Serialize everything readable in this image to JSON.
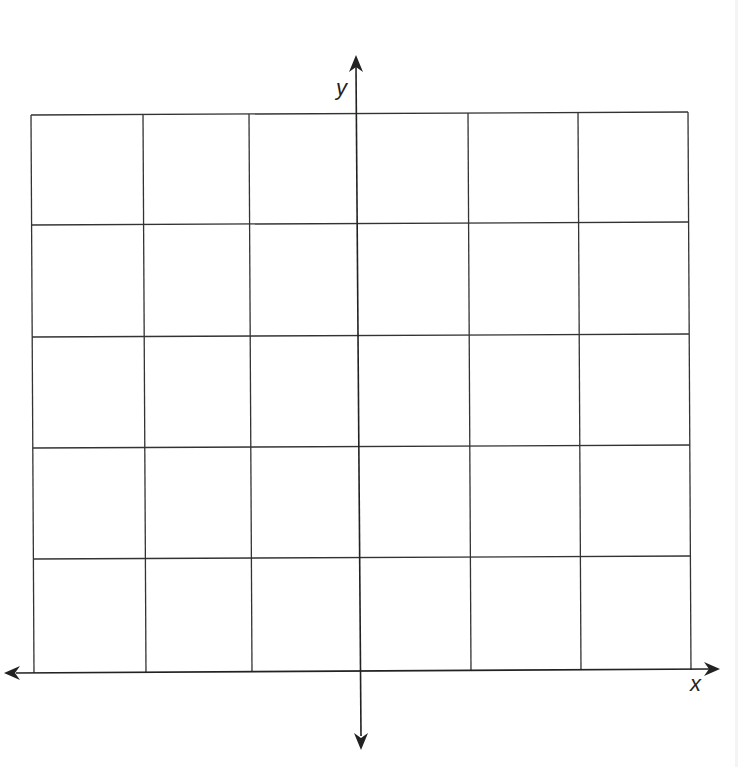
{
  "diagram": {
    "type": "coordinate-grid",
    "grid": {
      "columns": 6,
      "rows": 5,
      "line_color": "#333333",
      "vertical_lines": [
        {
          "x1": 31,
          "y1": 115,
          "x2": 34,
          "y2": 673
        },
        {
          "x1": 143,
          "y1": 114,
          "x2": 146,
          "y2": 673
        },
        {
          "x1": 249,
          "y1": 114,
          "x2": 252,
          "y2": 672
        },
        {
          "x1": 468,
          "y1": 113,
          "x2": 471,
          "y2": 671
        },
        {
          "x1": 578,
          "y1": 112,
          "x2": 581,
          "y2": 670
        },
        {
          "x1": 688,
          "y1": 112,
          "x2": 691,
          "y2": 670
        }
      ],
      "horizontal_lines": [
        {
          "x1": 31,
          "y1": 115,
          "x2": 688,
          "y2": 112
        },
        {
          "x1": 31,
          "y1": 225,
          "x2": 688,
          "y2": 222
        },
        {
          "x1": 32,
          "y1": 337,
          "x2": 689,
          "y2": 334
        },
        {
          "x1": 33,
          "y1": 448,
          "x2": 690,
          "y2": 445
        },
        {
          "x1": 33,
          "y1": 559,
          "x2": 690,
          "y2": 556
        }
      ]
    },
    "axes": {
      "x_axis": {
        "label": "x",
        "x1": 6,
        "y1": 673,
        "x2": 718,
        "y2": 669
      },
      "y_axis": {
        "label": "y",
        "x1": 356,
        "y1": 57,
        "x2": 361,
        "y2": 748
      },
      "color": "#222222"
    }
  }
}
